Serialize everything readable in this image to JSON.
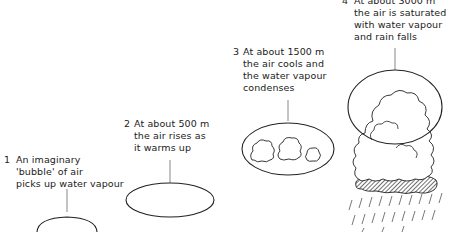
{
  "diagram": {
    "stages": [
      {
        "number": "1",
        "text": "An imaginary\n'bubble' of air\npicks up water vapour"
      },
      {
        "number": "2",
        "text": "At about 500 m\nthe air rises as\nit warms up"
      },
      {
        "number": "3",
        "text": "At about 1500 m\nthe air cools and\nthe water vapour\ncondenses"
      },
      {
        "number": "4",
        "text": "At about 3000 m\nthe air is saturated\nwith water vapour\nand rain falls"
      }
    ]
  }
}
